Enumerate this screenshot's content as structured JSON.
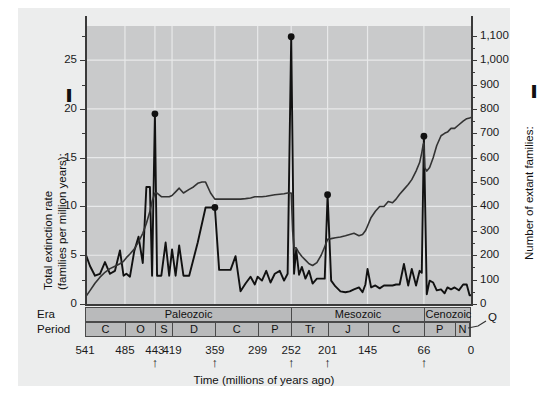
{
  "chart_data": {
    "type": "line",
    "title": "",
    "xlabel": "Time (millions of years ago)",
    "xlim": [
      541,
      0
    ],
    "x_ticks": [
      541,
      485,
      443,
      419,
      359,
      299,
      252,
      201,
      145,
      66,
      0
    ],
    "x_tick_labels": [
      "541",
      "485",
      "443",
      "419",
      "359",
      "299",
      "252",
      "201",
      "145",
      "66",
      "0"
    ],
    "mass_extinction_markers": [
      443,
      359,
      252,
      201,
      66
    ],
    "grid": true,
    "legend_position": "axis-titles",
    "axes": [
      {
        "side": "left",
        "label": "Total extinction rate (families per million years):",
        "label_line1": "Total extinction rate",
        "label_line2": "(families per million years):",
        "ylim": [
          0,
          28.5
        ],
        "ticks": [
          0,
          5,
          10,
          15,
          20,
          25
        ],
        "tick_labels": [
          "0",
          "5",
          "10",
          "15",
          "20",
          "25"
        ],
        "minor_tick_step": 2.5
      },
      {
        "side": "right",
        "label": "Number of extant families:",
        "ylim": [
          0,
          1140
        ],
        "ticks": [
          0,
          100,
          200,
          300,
          400,
          500,
          600,
          700,
          800,
          900,
          1000,
          1100
        ],
        "tick_labels": [
          "0",
          "100",
          "200",
          "300",
          "400",
          "500",
          "600",
          "700",
          "800",
          "900",
          "1,000",
          "1,100"
        ],
        "minor_tick_step": 50
      }
    ],
    "series": [
      {
        "name": "Total extinction rate (families per million years)",
        "axis": "left",
        "color": "#111111",
        "marked_peaks": [
          {
            "x": 443,
            "y": 19.5
          },
          {
            "x": 359,
            "y": 9.9
          },
          {
            "x": 252,
            "y": 27.4
          },
          {
            "x": 201,
            "y": 11.2
          },
          {
            "x": 66,
            "y": 17.2
          }
        ],
        "points": [
          [
            541,
            5.3
          ],
          [
            534,
            3.9
          ],
          [
            527,
            2.9
          ],
          [
            520,
            3.1
          ],
          [
            513,
            4.3
          ],
          [
            506,
            3.1
          ],
          [
            499,
            3.4
          ],
          [
            492,
            5.5
          ],
          [
            487,
            2.9
          ],
          [
            483,
            3.1
          ],
          [
            478,
            2.8
          ],
          [
            472,
            5.4
          ],
          [
            466,
            6.9
          ],
          [
            460,
            4.2
          ],
          [
            455,
            12.0
          ],
          [
            450,
            12.0
          ],
          [
            447,
            2.9
          ],
          [
            443,
            19.5
          ],
          [
            440,
            2.9
          ],
          [
            434,
            2.9
          ],
          [
            428,
            6.3
          ],
          [
            423,
            2.9
          ],
          [
            419,
            5.6
          ],
          [
            414,
            2.9
          ],
          [
            409,
            6.0
          ],
          [
            403,
            2.9
          ],
          [
            395,
            2.9
          ],
          [
            383,
            6.3
          ],
          [
            372,
            9.9
          ],
          [
            365,
            9.9
          ],
          [
            359,
            9.9
          ],
          [
            353,
            3.5
          ],
          [
            345,
            3.5
          ],
          [
            337,
            3.5
          ],
          [
            330,
            4.9
          ],
          [
            323,
            1.3
          ],
          [
            316,
            2.1
          ],
          [
            309,
            2.8
          ],
          [
            303,
            2.0
          ],
          [
            299,
            2.8
          ],
          [
            293,
            2.4
          ],
          [
            287,
            3.4
          ],
          [
            281,
            2.2
          ],
          [
            275,
            3.1
          ],
          [
            268,
            3.4
          ],
          [
            262,
            2.4
          ],
          [
            257,
            3.1
          ],
          [
            252,
            27.4
          ],
          [
            248,
            3.1
          ],
          [
            245,
            5.6
          ],
          [
            241,
            3.0
          ],
          [
            237,
            3.8
          ],
          [
            232,
            2.6
          ],
          [
            227,
            3.4
          ],
          [
            222,
            2.1
          ],
          [
            216,
            2.6
          ],
          [
            210,
            2.6
          ],
          [
            205,
            2.6
          ],
          [
            201,
            11.2
          ],
          [
            196,
            2.4
          ],
          [
            190,
            1.8
          ],
          [
            183,
            1.3
          ],
          [
            176,
            1.2
          ],
          [
            170,
            1.3
          ],
          [
            164,
            1.5
          ],
          [
            157,
            1.7
          ],
          [
            152,
            1.2
          ],
          [
            148,
            2.0
          ],
          [
            145,
            3.6
          ],
          [
            140,
            1.7
          ],
          [
            134,
            1.9
          ],
          [
            128,
            1.6
          ],
          [
            122,
            1.9
          ],
          [
            116,
            1.9
          ],
          [
            110,
            1.9
          ],
          [
            105,
            2.0
          ],
          [
            100,
            2.0
          ],
          [
            94,
            4.1
          ],
          [
            88,
            1.9
          ],
          [
            83,
            3.6
          ],
          [
            77,
            1.9
          ],
          [
            72,
            3.4
          ],
          [
            69,
            3.2
          ],
          [
            66,
            17.2
          ],
          [
            62,
            1.0
          ],
          [
            58,
            2.4
          ],
          [
            53,
            2.2
          ],
          [
            48,
            1.4
          ],
          [
            42,
            1.5
          ],
          [
            37,
            1.1
          ],
          [
            33,
            1.7
          ],
          [
            28,
            1.5
          ],
          [
            23,
            1.7
          ],
          [
            17,
            1.4
          ],
          [
            11,
            2.0
          ],
          [
            6,
            2.0
          ],
          [
            2,
            0.9
          ],
          [
            0,
            0.9
          ]
        ]
      },
      {
        "name": "Number of extant families",
        "axis": "right",
        "color": "#333333",
        "points": [
          [
            541,
            25
          ],
          [
            534,
            55
          ],
          [
            527,
            85
          ],
          [
            520,
            110
          ],
          [
            513,
            130
          ],
          [
            506,
            145
          ],
          [
            499,
            155
          ],
          [
            492,
            165
          ],
          [
            487,
            175
          ],
          [
            483,
            190
          ],
          [
            478,
            205
          ],
          [
            472,
            225
          ],
          [
            466,
            255
          ],
          [
            460,
            290
          ],
          [
            455,
            330
          ],
          [
            450,
            380
          ],
          [
            447,
            420
          ],
          [
            443,
            455
          ],
          [
            440,
            455
          ],
          [
            434,
            440
          ],
          [
            428,
            440
          ],
          [
            423,
            440
          ],
          [
            419,
            445
          ],
          [
            414,
            460
          ],
          [
            409,
            475
          ],
          [
            403,
            455
          ],
          [
            395,
            470
          ],
          [
            389,
            480
          ],
          [
            383,
            495
          ],
          [
            377,
            500
          ],
          [
            372,
            500
          ],
          [
            365,
            455
          ],
          [
            359,
            430
          ],
          [
            353,
            430
          ],
          [
            345,
            430
          ],
          [
            337,
            430
          ],
          [
            330,
            430
          ],
          [
            323,
            430
          ],
          [
            316,
            432
          ],
          [
            309,
            435
          ],
          [
            303,
            440
          ],
          [
            299,
            440
          ],
          [
            293,
            440
          ],
          [
            287,
            442
          ],
          [
            281,
            445
          ],
          [
            275,
            448
          ],
          [
            268,
            450
          ],
          [
            262,
            452
          ],
          [
            257,
            455
          ],
          [
            252,
            455
          ],
          [
            250,
            300
          ],
          [
            248,
            230
          ],
          [
            245,
            230
          ],
          [
            241,
            210
          ],
          [
            237,
            195
          ],
          [
            232,
            180
          ],
          [
            227,
            165
          ],
          [
            222,
            158
          ],
          [
            216,
            170
          ],
          [
            210,
            200
          ],
          [
            205,
            235
          ],
          [
            201,
            265
          ],
          [
            196,
            268
          ],
          [
            190,
            272
          ],
          [
            183,
            275
          ],
          [
            176,
            280
          ],
          [
            170,
            285
          ],
          [
            164,
            290
          ],
          [
            157,
            280
          ],
          [
            152,
            285
          ],
          [
            148,
            300
          ],
          [
            145,
            320
          ],
          [
            140,
            355
          ],
          [
            134,
            380
          ],
          [
            128,
            400
          ],
          [
            122,
            400
          ],
          [
            116,
            420
          ],
          [
            110,
            415
          ],
          [
            105,
            430
          ],
          [
            100,
            450
          ],
          [
            94,
            470
          ],
          [
            88,
            490
          ],
          [
            83,
            510
          ],
          [
            77,
            545
          ],
          [
            72,
            580
          ],
          [
            69,
            620
          ],
          [
            67,
            655
          ],
          [
            66,
            660
          ],
          [
            65,
            560
          ],
          [
            62,
            545
          ],
          [
            58,
            560
          ],
          [
            53,
            600
          ],
          [
            48,
            650
          ],
          [
            42,
            690
          ],
          [
            37,
            700
          ],
          [
            33,
            705
          ],
          [
            28,
            720
          ],
          [
            23,
            720
          ],
          [
            17,
            735
          ],
          [
            11,
            750
          ],
          [
            6,
            760
          ],
          [
            2,
            763
          ],
          [
            0,
            765
          ]
        ]
      }
    ],
    "timescale": {
      "era_row_label": "Era",
      "period_row_label": "Period",
      "eras": [
        {
          "name": "Paleozoic",
          "start": 541,
          "end": 252
        },
        {
          "name": "Mesozoic",
          "start": 252,
          "end": 66
        },
        {
          "name": "Cenozoic",
          "start": 66,
          "end": 0
        }
      ],
      "periods": [
        {
          "name": "C",
          "start": 541,
          "end": 485
        },
        {
          "name": "O",
          "start": 485,
          "end": 443
        },
        {
          "name": "S",
          "start": 443,
          "end": 419
        },
        {
          "name": "D",
          "start": 419,
          "end": 359
        },
        {
          "name": "C",
          "start": 359,
          "end": 299
        },
        {
          "name": "P",
          "start": 299,
          "end": 252
        },
        {
          "name": "Tr",
          "start": 252,
          "end": 201
        },
        {
          "name": "J",
          "start": 201,
          "end": 145
        },
        {
          "name": "C",
          "start": 145,
          "end": 66
        },
        {
          "name": "P",
          "start": 66,
          "end": 23
        },
        {
          "name": "N",
          "start": 23,
          "end": 2.6
        },
        {
          "name": "Q",
          "start": 2.6,
          "end": 0,
          "callout": true
        }
      ],
      "quaternary_callout_label": "Q"
    },
    "colors": {
      "panel_background": "#eceded",
      "plot_background": "#c9cacb",
      "gridline": "#e8e9ea",
      "band_fill": "#b9babb",
      "line": "#111111",
      "text": "#111111"
    }
  }
}
